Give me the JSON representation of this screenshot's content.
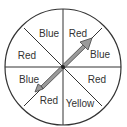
{
  "spinner": {
    "sections": [
      {
        "label": "Red"
      },
      {
        "label": "Blue"
      },
      {
        "label": "Red"
      },
      {
        "label": "Yellow"
      },
      {
        "label": "Red"
      },
      {
        "label": "Blue"
      },
      {
        "label": "Red"
      },
      {
        "label": "Blue"
      }
    ],
    "colors": {
      "outline": "#333333",
      "arrow_fill": "#9a9a9a",
      "arrow_stroke": "#444444",
      "background": "#ffffff"
    }
  }
}
